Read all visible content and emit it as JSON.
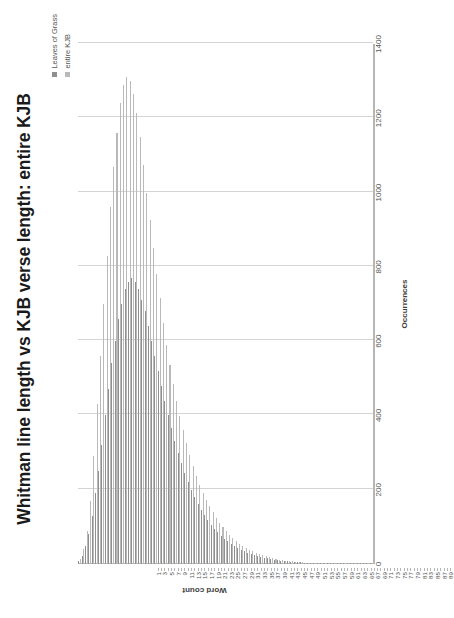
{
  "chart": {
    "title": "Whitman line length vs KJB verse length: entire KJB",
    "value_axis_title": "Occurrences",
    "category_axis_title": "Word count",
    "colors": {
      "series_0": "#8f8f8f",
      "series_1": "#b9b9b9",
      "gridline": "#d4d4d4",
      "axis": "#b6b6b6"
    }
  },
  "legend": {
    "position": "top-right",
    "items": [
      {
        "label": "Leaves of Grass",
        "color": "#8f8f8f"
      },
      {
        "label": "entire KJB",
        "color": "#b9b9b9"
      }
    ]
  },
  "chart_data": {
    "type": "bar",
    "orientation": "horizontal",
    "title": "Whitman line length vs KJB verse length: entire KJB",
    "xlabel": "Word count",
    "ylabel": "Occurrences",
    "ylim": [
      0,
      1400
    ],
    "grid": true,
    "legend_position": "top-right",
    "value_ticks": [
      0,
      200,
      400,
      600,
      800,
      1000,
      1200,
      1400
    ],
    "value_tick_labels": [
      "0",
      "200",
      "400",
      "600",
      "800",
      "1000",
      "1200",
      "1400"
    ],
    "categories": [
      1,
      2,
      3,
      4,
      5,
      6,
      7,
      8,
      9,
      10,
      11,
      12,
      13,
      14,
      15,
      16,
      17,
      18,
      19,
      20,
      21,
      22,
      23,
      24,
      25,
      26,
      27,
      28,
      29,
      30,
      31,
      32,
      33,
      34,
      35,
      36,
      37,
      38,
      39,
      40,
      41,
      42,
      43,
      44,
      45,
      46,
      47,
      48,
      49,
      50,
      51,
      52,
      53,
      54,
      55,
      56,
      57,
      58,
      59,
      60,
      61,
      62,
      63,
      64,
      65,
      66,
      67,
      68,
      69,
      70,
      71,
      72,
      73,
      74,
      75,
      76,
      77,
      78,
      79,
      80,
      81,
      82,
      83,
      84,
      85,
      86,
      87,
      88,
      89
    ],
    "category_tick_labels": [
      "1",
      "3",
      "5",
      "7",
      "9",
      "11",
      "13",
      "15",
      "17",
      "19",
      "21",
      "23",
      "25",
      "27",
      "29",
      "31",
      "33",
      "35",
      "37",
      "39",
      "41",
      "43",
      "45",
      "47",
      "49",
      "51",
      "53",
      "55",
      "57",
      "59",
      "61",
      "63",
      "65",
      "67",
      "69",
      "71",
      "73",
      "75",
      "77",
      "79",
      "81",
      "83",
      "85",
      "87",
      "89"
    ],
    "series": [
      {
        "name": "Leaves of Grass",
        "color": "#8f8f8f",
        "values": [
          8,
          22,
          48,
          80,
          130,
          190,
          250,
          320,
          400,
          470,
          540,
          600,
          660,
          700,
          740,
          760,
          770,
          760,
          740,
          710,
          680,
          640,
          600,
          560,
          520,
          480,
          440,
          400,
          365,
          330,
          300,
          272,
          246,
          222,
          200,
          180,
          162,
          146,
          131,
          118,
          106,
          95,
          85,
          76,
          68,
          61,
          54,
          48,
          43,
          38,
          34,
          30,
          27,
          24,
          21,
          19,
          17,
          15,
          13,
          12,
          10,
          9,
          8,
          7,
          6,
          6,
          5,
          5,
          4,
          4,
          3,
          3,
          3,
          2,
          2,
          2,
          2,
          2,
          1,
          1,
          1,
          1,
          1,
          1,
          1,
          1,
          1,
          1,
          1
        ]
      },
      {
        "name": "entire KJB",
        "color": "#b9b9b9",
        "values": [
          14,
          40,
          90,
          170,
          290,
          430,
          560,
          700,
          830,
          960,
          1070,
          1160,
          1240,
          1290,
          1310,
          1300,
          1265,
          1215,
          1150,
          1075,
          1000,
          925,
          850,
          780,
          715,
          650,
          590,
          535,
          485,
          440,
          398,
          360,
          325,
          293,
          264,
          238,
          214,
          192,
          172,
          155,
          139,
          124,
          111,
          99,
          88,
          79,
          70,
          62,
          55,
          49,
          44,
          39,
          34,
          30,
          27,
          24,
          21,
          18,
          16,
          14,
          12,
          11,
          9,
          8,
          7,
          6,
          6,
          5,
          4,
          4,
          3,
          3,
          3,
          2,
          2,
          2,
          2,
          1,
          1,
          1,
          1,
          1,
          1,
          1,
          1,
          1,
          1,
          1,
          1
        ]
      }
    ]
  }
}
